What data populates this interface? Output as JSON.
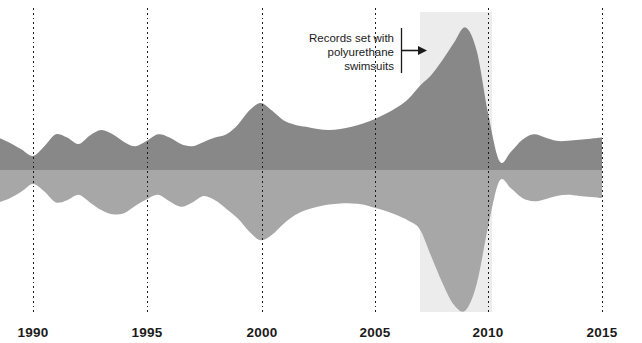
{
  "figure": {
    "background_color": "#ffffff",
    "width": 642,
    "height": 343
  },
  "annotation": {
    "line1": "Records set with",
    "line2": "polyurethane",
    "line3": "swimsuits",
    "arrow_direction": "right",
    "rule_label": "annotation-rule"
  },
  "axis": {
    "tick_labels": [
      "1990",
      "1995",
      "2000",
      "2005",
      "2010",
      "2015"
    ],
    "tick_values": [
      1990,
      1995,
      2000,
      2005,
      2010,
      2015
    ],
    "tick_x_px": [
      33,
      147,
      262,
      375,
      488,
      602
    ],
    "gridline_color": "#1b1b1b",
    "label_color": "#1b1b1b"
  },
  "highlight": {
    "label": "polyurethane-suit-era",
    "x_start_year": 2007.0,
    "x_end_year": 2010.2,
    "x_start_px": 420,
    "x_end_px": 492,
    "color": "#ececec"
  },
  "chart_data": {
    "type": "area",
    "subtype": "streamgraph",
    "title": "",
    "subtitle": "",
    "xlabel": "",
    "ylabel": "",
    "xlim": [
      1988.5,
      2015.0
    ],
    "ylim": [
      -1,
      1
    ],
    "grid": true,
    "grid_axis": "x",
    "legend": false,
    "legend_position": "none",
    "baseline": "wiggle",
    "colors": {
      "series_upper": "#a7a7a7",
      "series_lower": "#888888",
      "highlight_band": "#ececec",
      "gridline": "#1b1b1b"
    },
    "x": [
      1988.5,
      1989,
      1989.5,
      1990,
      1990.5,
      1991,
      1991.5,
      1992,
      1992.5,
      1993,
      1993.5,
      1994,
      1994.5,
      1995,
      1995.5,
      1996,
      1996.5,
      1997,
      1997.5,
      1998,
      1998.5,
      1999,
      1999.5,
      2000,
      2000.5,
      2001,
      2001.5,
      2002,
      2002.5,
      2003,
      2003.5,
      2004,
      2004.5,
      2005,
      2005.5,
      2006,
      2006.5,
      2007,
      2007.5,
      2008,
      2008.5,
      2009,
      2009.5,
      2010,
      2010.5,
      2011,
      2011.5,
      2012,
      2012.5,
      2013,
      2013.5,
      2014,
      2014.5,
      2015
    ],
    "series": [
      {
        "name": "Men's records",
        "color": "#a7a7a7",
        "stack_position": "upper",
        "values": [
          0.3,
          0.26,
          0.2,
          0.13,
          0.2,
          0.3,
          0.28,
          0.23,
          0.3,
          0.37,
          0.41,
          0.4,
          0.33,
          0.27,
          0.23,
          0.29,
          0.34,
          0.3,
          0.24,
          0.28,
          0.36,
          0.45,
          0.57,
          0.65,
          0.6,
          0.5,
          0.42,
          0.37,
          0.34,
          0.32,
          0.31,
          0.31,
          0.32,
          0.35,
          0.38,
          0.42,
          0.47,
          0.55,
          0.8,
          1.05,
          1.25,
          1.3,
          1.05,
          0.52,
          0.1,
          0.17,
          0.26,
          0.29,
          0.27,
          0.24,
          0.23,
          0.24,
          0.25,
          0.26
        ]
      },
      {
        "name": "Women's records",
        "color": "#888888",
        "stack_position": "lower",
        "values": [
          0.3,
          0.25,
          0.19,
          0.13,
          0.22,
          0.33,
          0.3,
          0.24,
          0.32,
          0.37,
          0.33,
          0.26,
          0.22,
          0.27,
          0.33,
          0.3,
          0.24,
          0.22,
          0.26,
          0.3,
          0.33,
          0.42,
          0.55,
          0.62,
          0.55,
          0.46,
          0.42,
          0.4,
          0.38,
          0.37,
          0.38,
          0.4,
          0.43,
          0.47,
          0.52,
          0.58,
          0.66,
          0.78,
          0.88,
          1.02,
          1.18,
          1.32,
          1.1,
          0.52,
          0.08,
          0.17,
          0.28,
          0.33,
          0.3,
          0.27,
          0.27,
          0.28,
          0.29,
          0.3
        ]
      }
    ],
    "annotations": [
      {
        "text": "Records set with polyurethane swimsuits",
        "x_year": 2007.6,
        "points_to": "peak",
        "arrow": true
      }
    ]
  }
}
